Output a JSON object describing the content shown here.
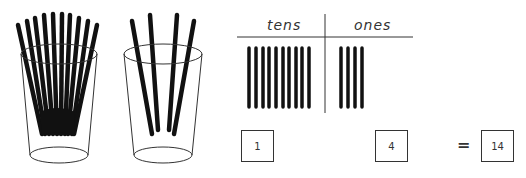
{
  "diagram": {
    "cups": [
      {
        "name": "tens-cup",
        "straws": 10
      },
      {
        "name": "ones-cup",
        "straws": 4
      }
    ],
    "chart": {
      "headers": {
        "tens": "tens",
        "ones": "ones"
      },
      "tens_bars": 10,
      "ones_bars": 4
    },
    "equation": {
      "tens_value": "1",
      "ones_value": "4",
      "equals": "=",
      "total": "14"
    },
    "colors": {
      "ink": "#111111",
      "line": "#333333",
      "background": "#ffffff"
    }
  }
}
